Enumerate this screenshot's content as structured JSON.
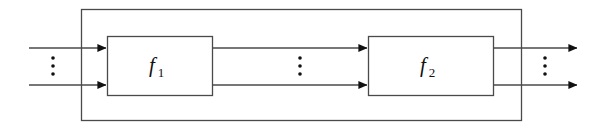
{
  "figure": {
    "kind": "block-diagram",
    "title": "",
    "background_color": "#ffffff",
    "line_color": "#333333",
    "text_color": "#111111",
    "width": 598,
    "height": 130
  },
  "outer_block": {
    "name": "outer-system-boundary",
    "label": "",
    "x": 81,
    "y": 9,
    "width": 440,
    "height": 111,
    "stroke": "#4a4a4a",
    "stroke_width": 1.3,
    "fill": "none"
  },
  "blocks": [
    {
      "id": "f1",
      "label": "f",
      "subscript": "1",
      "x": 107,
      "y": 36,
      "width": 105,
      "height": 59,
      "stroke": "#4a4a4a",
      "stroke_width": 1.3,
      "fill": "#ffffff"
    },
    {
      "id": "f2",
      "label": "f",
      "subscript": "2",
      "x": 368,
      "y": 36,
      "width": 125,
      "height": 59,
      "stroke": "#4a4a4a",
      "stroke_width": 1.3,
      "fill": "#ffffff"
    }
  ],
  "signals": {
    "top_y": 48,
    "bottom_y": 85,
    "stroke": "#4a4a4a",
    "stroke_width": 1.3,
    "arrow_fill": "#111111"
  },
  "input_arrows": [
    {
      "id": "input-top",
      "from_x": 29,
      "to_x": 107,
      "y": 48
    },
    {
      "id": "input-bottom",
      "from_x": 29,
      "to_x": 107,
      "y": 85
    }
  ],
  "middle_arrows": [
    {
      "id": "f1-to-f2-top",
      "from_x": 212,
      "to_x": 368,
      "y": 48
    },
    {
      "id": "f1-to-f2-bottom",
      "from_x": 212,
      "to_x": 368,
      "y": 85
    }
  ],
  "output_arrows": [
    {
      "id": "output-top",
      "from_x": 493,
      "to_x": 578,
      "y": 48
    },
    {
      "id": "output-bottom",
      "from_x": 493,
      "to_x": 578,
      "y": 85
    }
  ],
  "ellipses": [
    {
      "id": "input-ellipsis",
      "glyph": "⋮",
      "x": 53,
      "y": 66,
      "dot_count": 3
    },
    {
      "id": "middle-ellipsis",
      "glyph": "⋮",
      "x": 300,
      "y": 66,
      "dot_count": 3
    },
    {
      "id": "output-ellipsis",
      "glyph": "⋮",
      "x": 545,
      "y": 66,
      "dot_count": 3
    }
  ]
}
